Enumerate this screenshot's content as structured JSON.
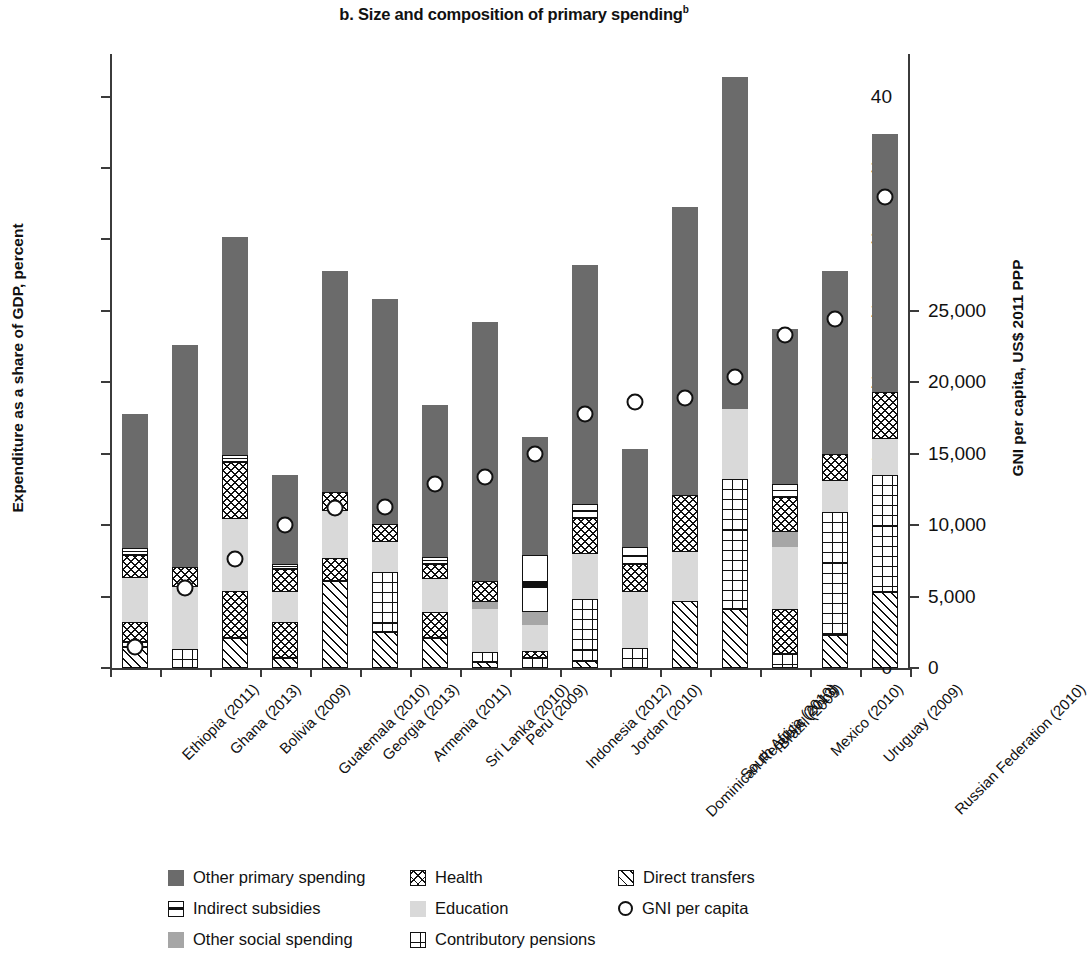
{
  "chart_data": {
    "type": "bar",
    "title": "b. Size and composition of primary spending",
    "title_superscript": "b",
    "subtitle": "",
    "stacked": true,
    "ylabel": "Expenditure as a share of GDP, percent",
    "ylabel_right": "GNI per capita, US$ 2011 PPP",
    "xlabel": "",
    "ylim": [
      0,
      42
    ],
    "ylim_right": [
      0,
      25000
    ],
    "yticks": [
      "0",
      "5",
      "10",
      "15",
      "20",
      "25",
      "30",
      "35",
      "40"
    ],
    "ytick_values": [
      0,
      5,
      10,
      15,
      20,
      25,
      30,
      35,
      40
    ],
    "yticks_right": [
      "0",
      "5,000",
      "10,000",
      "15,000",
      "20,000",
      "25,000"
    ],
    "ytick_values_right": [
      0,
      5000,
      10000,
      15000,
      20000,
      25000
    ],
    "grid": false,
    "legend_position": "bottom",
    "categories": [
      "Ethiopia (2011)",
      "Ghana (2013)",
      "Bolivia (2009)",
      "Guatemala (2010)",
      "Georgia (2013)",
      "Armenia (2011)",
      "Sri Lanka (2010)",
      "Peru (2009)",
      "Indonesia (2012)",
      "Jordan (2010)",
      "Dominican Republic (2013)",
      "South Africa (2010)",
      "Brazil (2009)",
      "Mexico (2010)",
      "Uruguay (2009)",
      "Russian Federation (2010)"
    ],
    "stack_order": [
      "direct",
      "pensions",
      "health",
      "education",
      "other_social",
      "indirect",
      "other_primary"
    ],
    "series": [
      {
        "name": "Direct transfers",
        "key": "direct",
        "values": [
          1.5,
          0.0,
          2.1,
          0.7,
          6.1,
          2.5,
          2.1,
          0.4,
          0.0,
          0.5,
          0.0,
          4.7,
          4.1,
          0.0,
          2.3,
          5.3
        ]
      },
      {
        "name": "Contributory pensions",
        "key": "pensions",
        "values": [
          0.3,
          1.3,
          0.0,
          0.0,
          0.0,
          4.2,
          0.0,
          0.7,
          0.7,
          4.3,
          1.4,
          0.0,
          9.1,
          1.0,
          8.6,
          8.2
        ]
      },
      {
        "name": "Health",
        "key": "health",
        "values": [
          1.4,
          0.0,
          3.3,
          2.5,
          1.6,
          0.0,
          1.8,
          0.0,
          0.5,
          0.0,
          0.0,
          0.0,
          0.0,
          3.1,
          0.0,
          0.0
        ]
      },
      {
        "name": "Education",
        "key": "education",
        "values": [
          3.1,
          4.4,
          5.0,
          2.1,
          3.3,
          2.1,
          2.3,
          3.0,
          1.8,
          3.2,
          3.9,
          3.4,
          4.9,
          4.4,
          2.2,
          2.5
        ]
      },
      {
        "name": "Other social spending",
        "key": "other_social",
        "values": [
          0.0,
          0.0,
          0.0,
          0.0,
          0.0,
          0.0,
          0.0,
          0.5,
          0.9,
          0.0,
          0.0,
          0.0,
          0.0,
          1.0,
          0.0,
          0.0
        ]
      },
      {
        "name": "Health (upper)",
        "key": "health2",
        "values": [
          1.6,
          1.4,
          4.0,
          1.6,
          1.3,
          1.3,
          1.1,
          1.5,
          0.0,
          2.5,
          2.0,
          4.0,
          0.0,
          2.5,
          1.9,
          3.3
        ]
      },
      {
        "name": "Indirect subsidies",
        "key": "indirect",
        "values": [
          0.5,
          0.0,
          0.5,
          0.4,
          0.0,
          0.0,
          0.5,
          0.0,
          4.0,
          1.0,
          1.2,
          0.0,
          0.0,
          0.9,
          0.0,
          0.0
        ]
      },
      {
        "name": "Other primary spending",
        "key": "other_primary",
        "values": [
          9.4,
          15.5,
          15.3,
          6.2,
          15.5,
          15.7,
          10.6,
          18.1,
          8.3,
          16.7,
          6.8,
          20.2,
          23.3,
          10.8,
          12.8,
          18.1
        ]
      }
    ],
    "totals": [
      18.2,
      22.6,
      33.3,
      13.6,
      27.9,
      25.9,
      18.5,
      24.2,
      16.2,
      28.3,
      15.3,
      32.3,
      41.4,
      23.7,
      27.9,
      37.5
    ],
    "gni_series": {
      "name": "GNI per capita",
      "marker": "open-circle",
      "values": [
        1250,
        3750,
        4950,
        6350,
        7100,
        7100,
        8100,
        8400,
        9400,
        11000,
        11500,
        11700,
        12600,
        14300,
        15000,
        20150
      ]
    },
    "gni_in_percent_units": [
      2.1,
      6.2,
      8.2,
      10.6,
      11.8,
      11.9,
      13.5,
      14.0,
      15.6,
      18.4,
      19.2,
      19.5,
      21.0,
      23.9,
      25.0,
      33.6
    ],
    "colors": {
      "other_primary": "#6b6b6b",
      "other_social": "#a6a6a6",
      "education": "#d9d9d9",
      "indirect": "#ffffff",
      "health": "#ffffff",
      "pensions": "#ffffff",
      "direct": "#ffffff",
      "axis": "#3b3b3b",
      "text": "#111111"
    },
    "legend": {
      "columns": [
        [
          {
            "key": "other_primary",
            "label": "Other primary spending"
          },
          {
            "key": "indirect",
            "label": "Indirect subsidies"
          },
          {
            "key": "other_social",
            "label": "Other social spending"
          }
        ],
        [
          {
            "key": "health",
            "label": "Health"
          },
          {
            "key": "education",
            "label": "Education"
          },
          {
            "key": "pensions",
            "label": "Contributory pensions"
          }
        ],
        [
          {
            "key": "direct",
            "label": "Direct transfers"
          },
          {
            "key": "gni",
            "label": "GNI per capita"
          }
        ]
      ]
    }
  }
}
